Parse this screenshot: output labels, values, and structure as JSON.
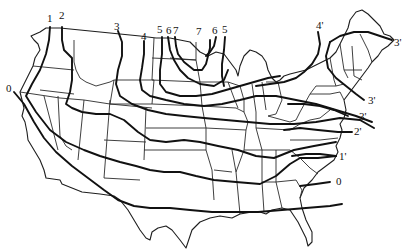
{
  "map": {
    "subject": "Contiguous United States with isolines",
    "colors": {
      "line": "#111111",
      "border": "#2a2a2a",
      "background": "#ffffff"
    },
    "isolines": [
      {
        "id": "iso-0-west",
        "label": "0"
      },
      {
        "id": "iso-1",
        "label": "1"
      },
      {
        "id": "iso-2",
        "label": "2"
      },
      {
        "id": "iso-3",
        "label": "3"
      },
      {
        "id": "iso-4",
        "label": "4"
      },
      {
        "id": "iso-5-west",
        "label": "5"
      },
      {
        "id": "iso-6-west",
        "label": "6"
      },
      {
        "id": "iso-7-west",
        "label": "7"
      },
      {
        "id": "iso-7-east",
        "label": "7"
      },
      {
        "id": "iso-6-east",
        "label": "6"
      },
      {
        "id": "iso-5-east",
        "label": "5"
      },
      {
        "id": "iso-4p",
        "label": "4'"
      },
      {
        "id": "iso-3p-ne",
        "label": "3'"
      },
      {
        "id": "iso-3p-mid",
        "label": "3'"
      },
      {
        "id": "iso-3p-south",
        "label": "3'"
      },
      {
        "id": "iso-2p",
        "label": "2'"
      },
      {
        "id": "iso-1p",
        "label": "1'"
      },
      {
        "id": "iso-0-east",
        "label": "0"
      }
    ]
  }
}
